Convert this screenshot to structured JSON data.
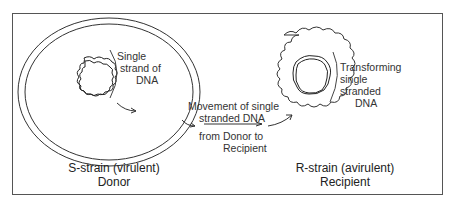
{
  "diagram": {
    "donor": {
      "annotation": [
        "Single",
        "strand of",
        "DNA"
      ],
      "caption_line1": "S-strain (virulent)",
      "caption_line2": "Donor"
    },
    "recipient": {
      "annotation": [
        "Transforming",
        "single",
        "stranded",
        "DNA"
      ],
      "caption_line1": "R-strain (avirulent)",
      "caption_line2": "Recipient"
    },
    "transfer": {
      "above_arrow": [
        "Movement of single",
        "stranded DNA"
      ],
      "below_arrow": [
        "from Donor to",
        "Recipient"
      ]
    },
    "colors": {
      "line": "#333333",
      "frame": "#555555",
      "background": "#ffffff"
    }
  }
}
